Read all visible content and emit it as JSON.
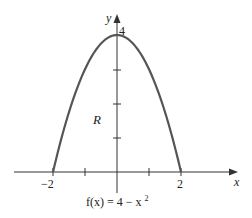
{
  "chart_data": {
    "type": "line",
    "title": "",
    "function_label": "f(x) = 4 − x²",
    "function_label_parts": {
      "lhs": "f(x) = 4 − x",
      "exp": "2"
    },
    "region_label": "R",
    "xlabel": "x",
    "ylabel": "y",
    "x_tick_labels": [
      "−2",
      "2"
    ],
    "y_tick_labels": [
      "4"
    ],
    "x_ticks": [
      -2,
      -1,
      1,
      2
    ],
    "y_ticks": [
      1,
      2,
      3,
      4
    ],
    "xlim": [
      -3.2,
      3.8
    ],
    "ylim": [
      -0.6,
      4.6
    ],
    "grid": false,
    "series": [
      {
        "name": "f(x) = 4 − x²",
        "x": [
          -2,
          -1.5,
          -1,
          -0.5,
          0,
          0.5,
          1,
          1.5,
          2
        ],
        "y": [
          0,
          1.75,
          3,
          3.75,
          4,
          3.75,
          3,
          1.75,
          0
        ]
      }
    ]
  }
}
